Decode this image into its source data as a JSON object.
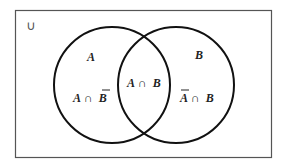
{
  "diagram": {
    "type": "venn",
    "universe_symbol": "∪",
    "sets": [
      {
        "name": "A",
        "label": "A"
      },
      {
        "name": "B",
        "label": "B"
      }
    ],
    "regions": {
      "a_only": {
        "parts": [
          "A",
          " ∩ ",
          "B"
        ],
        "bar_on": "B"
      },
      "intersection": {
        "parts": [
          "A",
          " ∩ ",
          "B"
        ]
      },
      "b_only": {
        "parts": [
          "A",
          " ∩ ",
          "B"
        ],
        "bar_on": "A"
      }
    },
    "colors": {
      "stroke": "#111111",
      "border": "#555555",
      "text": "#222222"
    }
  }
}
